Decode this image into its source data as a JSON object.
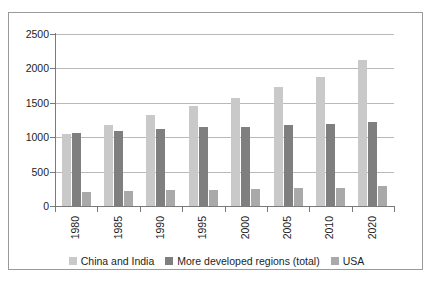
{
  "chart_data": {
    "type": "bar",
    "title": "",
    "xlabel": "",
    "ylabel": "",
    "ylim": [
      0,
      2500
    ],
    "yticks": [
      0,
      500,
      1000,
      1500,
      2000,
      2500
    ],
    "ytick_labels": [
      "0",
      "500",
      "1000",
      "1500",
      "2000",
      "2500"
    ],
    "grid": true,
    "legend_position": "bottom",
    "categories": [
      "1980",
      "1985",
      "1990",
      "1995",
      "2000",
      "2005",
      "2010",
      "2020"
    ],
    "series": [
      {
        "name": "China and India",
        "color": "#c9c9c9",
        "values": [
          1040,
          1180,
          1320,
          1450,
          1570,
          1730,
          1880,
          2120
        ]
      },
      {
        "name": "More developed regions (total)",
        "color": "#7f7f7f",
        "values": [
          1060,
          1090,
          1120,
          1145,
          1155,
          1175,
          1185,
          1215
        ]
      },
      {
        "name": "USA",
        "color": "#a9a9a9",
        "values": [
          200,
          215,
          230,
          230,
          250,
          255,
          265,
          290
        ]
      }
    ]
  },
  "legend": {
    "items": [
      {
        "label": "China and India",
        "swatch": "legend-swatch-china-india"
      },
      {
        "label": "More developed regions (total)",
        "swatch": "legend-swatch-more-developed"
      },
      {
        "label": "USA",
        "swatch": "legend-swatch-usa"
      }
    ]
  },
  "colors": {
    "series_light": "#c9c9c9",
    "series_dark": "#7f7f7f",
    "series_medium": "#a9a9a9",
    "gridline": "#b9b9b9",
    "axis": "#7a7a7a",
    "border": "#9a9a9a",
    "text": "#1d1d1d",
    "background": "#ffffff"
  }
}
